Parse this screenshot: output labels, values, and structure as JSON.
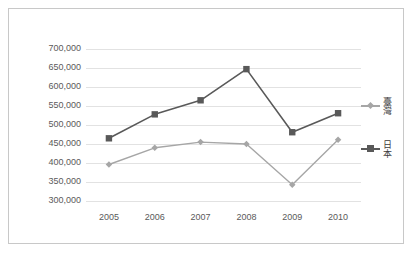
{
  "chart_data": {
    "type": "line",
    "title": "",
    "xlabel": "",
    "ylabel": "",
    "categories": [
      "2005",
      "2006",
      "2007",
      "2008",
      "2009",
      "2010"
    ],
    "ylim": [
      300000,
      700000
    ],
    "ytick_step": 50000,
    "ytick_labels": [
      "700,000",
      "650,000",
      "600,000",
      "550,000",
      "500,000",
      "450,000",
      "400,000",
      "350,000",
      "300,000"
    ],
    "ytick_values": [
      700000,
      650000,
      600000,
      550000,
      500000,
      450000,
      400000,
      350000,
      300000
    ],
    "grid": true,
    "legend_position": "right",
    "series": [
      {
        "name": "臺灣",
        "color": "#a6a6a6",
        "marker": "diamond",
        "values": [
          396000,
          440000,
          455000,
          450000,
          343000,
          461000
        ]
      },
      {
        "name": "日本",
        "color": "#595959",
        "marker": "square",
        "values": [
          465000,
          528000,
          565000,
          647000,
          481000,
          531000
        ]
      }
    ]
  },
  "legend": {
    "entries": [
      {
        "label": "臺灣"
      },
      {
        "label": "日本"
      }
    ]
  },
  "colors": {
    "frame_border": "#c8c8c8",
    "gridline": "#e2e2e2",
    "axis_text": "#5a5a5a",
    "taiwan": "#a6a6a6",
    "japan": "#595959",
    "background": "#ffffff"
  }
}
